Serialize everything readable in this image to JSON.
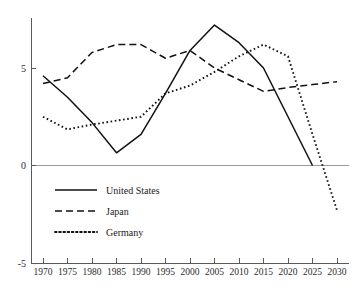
{
  "chart_data": {
    "type": "line",
    "title": "",
    "subtitle": "",
    "xlabel": "",
    "ylabel": "",
    "xlim": [
      1970,
      2030
    ],
    "ylim": [
      -5,
      5
    ],
    "grid": false,
    "legend_position": "inside-lower-left",
    "zero_reference_line": true,
    "x": [
      1970,
      1975,
      1980,
      1985,
      1990,
      1995,
      2000,
      2005,
      2010,
      2015,
      2020,
      2025,
      2030
    ],
    "xticks": [
      "1970",
      "1975",
      "1980",
      "1985",
      "1990",
      "1995",
      "2000",
      "2005",
      "2010",
      "2015",
      "2020",
      "2025",
      "2030"
    ],
    "yticks": [
      "5",
      "0",
      "-5"
    ],
    "ytick_values": [
      5,
      0,
      -5
    ],
    "series": [
      {
        "name": "United States",
        "style": "solid",
        "color": "#111111",
        "x": [
          1970,
          1975,
          1980,
          1985,
          1990,
          1995,
          2000,
          2005,
          2010,
          2015,
          2020,
          2025
        ],
        "values": [
          4.6,
          3.5,
          2.2,
          0.65,
          1.6,
          3.7,
          5.9,
          7.2,
          6.3,
          5.0,
          2.5,
          0.0
        ]
      },
      {
        "name": "Japan",
        "style": "dashed",
        "color": "#111111",
        "x": [
          1970,
          1975,
          1980,
          1985,
          1990,
          1995,
          2000,
          2005,
          2010,
          2015,
          2020,
          2025,
          2030
        ],
        "values": [
          4.2,
          4.5,
          5.8,
          6.2,
          6.2,
          5.5,
          5.9,
          5.0,
          4.4,
          3.8,
          4.0,
          4.15,
          4.3
        ]
      },
      {
        "name": "Germany",
        "style": "dotted",
        "color": "#111111",
        "x": [
          1970,
          1975,
          1980,
          1985,
          1990,
          1995,
          2000,
          2005,
          2010,
          2015,
          2020,
          2025,
          2030
        ],
        "values": [
          2.5,
          1.85,
          2.1,
          2.3,
          2.5,
          3.7,
          4.1,
          4.8,
          5.6,
          6.2,
          5.6,
          1.6,
          -2.3
        ]
      }
    ]
  },
  "legend": {
    "items": [
      {
        "label": "United States",
        "style": "solid"
      },
      {
        "label": "Japan",
        "style": "dashed"
      },
      {
        "label": "Germany",
        "style": "dotted"
      }
    ]
  }
}
